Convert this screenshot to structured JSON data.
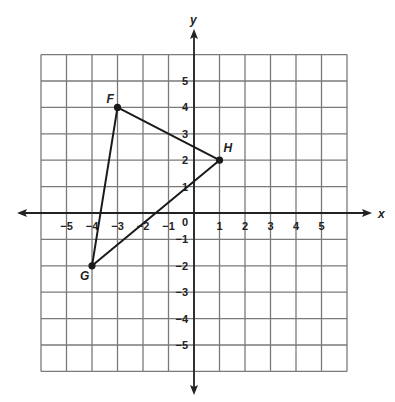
{
  "chart_data": {
    "type": "scatter",
    "title": "",
    "xlabel": "x",
    "ylabel": "y",
    "xlim": [
      -6,
      6
    ],
    "ylim": [
      -6,
      6
    ],
    "grid": true,
    "x_ticks": [
      -5,
      -4,
      -3,
      -2,
      -1,
      1,
      2,
      3,
      4,
      5
    ],
    "y_ticks": [
      -5,
      -4,
      -3,
      -2,
      -1,
      1,
      2,
      3,
      4,
      5
    ],
    "origin_label": "0",
    "points": [
      {
        "label": "F",
        "x": -3,
        "y": 4
      },
      {
        "label": "G",
        "x": -4,
        "y": -2
      },
      {
        "label": "H",
        "x": 1,
        "y": 2
      }
    ],
    "polygon": {
      "name": "triangle FGH",
      "vertices": [
        "F",
        "G",
        "H"
      ]
    }
  },
  "colors": {
    "grid": "#7a7a7a",
    "axis": "#222222",
    "shape": "#1a1a1a",
    "background": "#ffffff"
  }
}
